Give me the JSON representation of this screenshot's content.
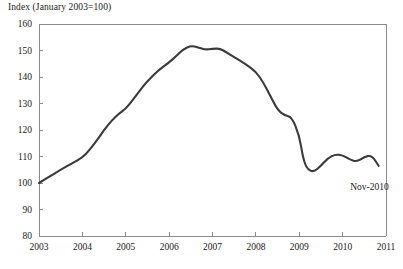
{
  "chart_data": {
    "type": "line",
    "title": "Index (January 2003=100)",
    "xlabel": "",
    "ylabel": "Index (January 2003=100)",
    "xlim": [
      2003,
      2011
    ],
    "ylim": [
      80,
      160
    ],
    "ytick_labels": [
      "160",
      "150",
      "140",
      "130",
      "120",
      "110",
      "100",
      "90",
      "80"
    ],
    "ytick_values": [
      160,
      150,
      140,
      130,
      120,
      110,
      100,
      90,
      80
    ],
    "xtick_labels": [
      "2003",
      "2004",
      "2005",
      "2006",
      "2007",
      "2008",
      "2009",
      "2010",
      "2011"
    ],
    "xtick_values": [
      2003,
      2004,
      2005,
      2006,
      2007,
      2008,
      2009,
      2010,
      2011
    ],
    "grid": false,
    "legend": null,
    "line_color": "#3b3b3b",
    "annotations": [
      {
        "text": "Nov-2010",
        "x": 2010.62,
        "y": 97.5
      }
    ],
    "series": [
      {
        "name": "Index",
        "x": [
          2003.0,
          2003.25,
          2003.5,
          2003.75,
          2004.0,
          2004.17,
          2004.33,
          2004.5,
          2004.67,
          2004.83,
          2005.0,
          2005.17,
          2005.33,
          2005.5,
          2005.75,
          2006.0,
          2006.17,
          2006.33,
          2006.5,
          2006.67,
          2006.83,
          2007.0,
          2007.17,
          2007.33,
          2007.5,
          2007.75,
          2008.0,
          2008.17,
          2008.33,
          2008.5,
          2008.67,
          2008.83,
          2009.0,
          2009.08,
          2009.17,
          2009.33,
          2009.5,
          2009.67,
          2009.83,
          2010.0,
          2010.17,
          2010.33,
          2010.5,
          2010.67,
          2010.83
        ],
        "values": [
          100.0,
          102.5,
          105.0,
          107.3,
          109.6,
          112.5,
          116.0,
          120.0,
          123.5,
          126.0,
          128.0,
          131.5,
          135.0,
          138.5,
          142.5,
          145.5,
          148.0,
          150.5,
          151.8,
          151.2,
          150.3,
          150.6,
          150.8,
          149.2,
          147.5,
          145.0,
          142.0,
          138.0,
          133.0,
          127.5,
          125.5,
          124.8,
          118.0,
          110.0,
          105.5,
          104.0,
          106.5,
          109.5,
          110.8,
          110.5,
          108.8,
          108.0,
          109.8,
          110.5,
          106.5
        ]
      }
    ]
  },
  "axes": {
    "top_border": true,
    "right_border": true,
    "left_axis": true,
    "bottom_axis": true
  }
}
